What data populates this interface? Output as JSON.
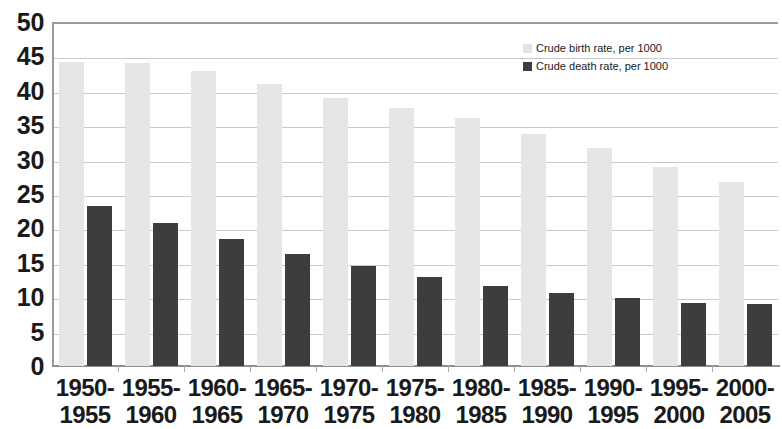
{
  "chart_data": {
    "type": "bar",
    "title": "",
    "subtitle": "",
    "xlabel": "",
    "ylabel": "",
    "ylim": [
      0,
      50
    ],
    "ytick_step": 5,
    "yticks": [
      "50",
      "45",
      "40",
      "35",
      "30",
      "25",
      "20",
      "15",
      "10",
      "5",
      "0"
    ],
    "grid": true,
    "legend_position": "top-right",
    "categories": [
      "1950-\n1955",
      "1955-\n1960",
      "1960-\n1965",
      "1965-\n1970",
      "1970-\n1975",
      "1975-\n1980",
      "1980-\n1985",
      "1985-\n1990",
      "1990-\n1995",
      "1995-\n2000",
      "2000-\n2005"
    ],
    "category_lines": [
      [
        "1950-",
        "1955"
      ],
      [
        "1955-",
        "1960"
      ],
      [
        "1960-",
        "1965"
      ],
      [
        "1965-",
        "1970"
      ],
      [
        "1970-",
        "1975"
      ],
      [
        "1975-",
        "1980"
      ],
      [
        "1980-",
        "1985"
      ],
      [
        "1985-",
        "1990"
      ],
      [
        "1990-",
        "1995"
      ],
      [
        "1995-",
        "2000"
      ],
      [
        "2000-",
        "2005"
      ]
    ],
    "series": [
      {
        "name": "Crude birth rate, per 1000",
        "color": "#e6e6e6",
        "values": [
          44.2,
          44.0,
          42.9,
          41.0,
          39.0,
          37.5,
          36.0,
          33.7,
          31.7,
          28.9,
          26.8
        ]
      },
      {
        "name": "Crude death rate, per 1000",
        "color": "#3d3d3d",
        "values": [
          23.3,
          20.8,
          18.5,
          16.3,
          14.5,
          12.9,
          11.6,
          10.6,
          9.9,
          9.2,
          9.0
        ]
      }
    ]
  },
  "legend": {
    "items": [
      {
        "label": "Crude birth rate, per 1000",
        "swatch": "legend-swatch-birth"
      },
      {
        "label": "Crude death rate, per 1000",
        "swatch": "legend-swatch-death"
      }
    ]
  }
}
